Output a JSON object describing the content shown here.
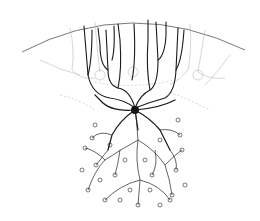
{
  "figure": {
    "background": "#ffffff",
    "ink": "#1a1a1a",
    "faint_ink": "#b8b8b8"
  }
}
